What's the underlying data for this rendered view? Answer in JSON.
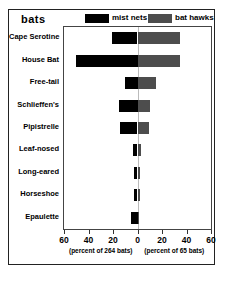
{
  "figure": {
    "title": "bats"
  },
  "legend": {
    "position": "top-right",
    "entries": [
      {
        "label": "mist nets",
        "color": "#000000",
        "icon": "legend-swatch-icon"
      },
      {
        "label": "bat hawks",
        "color": "#4d4d4d",
        "icon": "legend-swatch-icon"
      }
    ]
  },
  "axis": {
    "tick_labels": [
      "60",
      "40",
      "20",
      "0",
      "20",
      "40",
      "60"
    ],
    "tick_values": [
      -60,
      -40,
      -20,
      0,
      20,
      40,
      60
    ],
    "caption_left": "(percent of 264 bats)",
    "caption_right": "(percent of 65 bats)"
  },
  "chart_data": {
    "type": "bar",
    "title": "bats",
    "orientation": "horizontal",
    "style": "diverging",
    "xlabel": "",
    "ylabel": "",
    "xlim": [
      -60,
      60
    ],
    "grid": false,
    "legend_position": "top-right",
    "categories": [
      "Cape Serotine",
      "House Bat",
      "Free-tail",
      "Schlieffen's",
      "Pipistrelle",
      "Leaf-nosed",
      "Long-eared",
      "Horseshoe",
      "Epaulette"
    ],
    "series": [
      {
        "name": "mist nets",
        "color": "#000000",
        "direction": "left",
        "note": "percent of 264 bats",
        "values": [
          21,
          50,
          10,
          15,
          14,
          4,
          3,
          3,
          5
        ]
      },
      {
        "name": "bat hawks",
        "color": "#4d4d4d",
        "direction": "right",
        "note": "percent of 65 bats",
        "values": [
          35,
          35,
          15,
          10,
          9,
          3,
          2,
          2,
          1
        ]
      }
    ]
  }
}
